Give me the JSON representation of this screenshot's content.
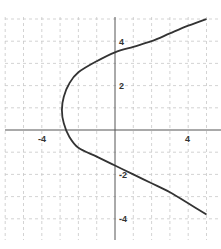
{
  "chart_data": {
    "type": "line",
    "title": "",
    "xlabel": "",
    "ylabel": "",
    "xlim": [
      -6.3,
      5.7
    ],
    "ylim": [
      -5.4,
      5.9
    ],
    "grid": true,
    "x_ticks": [
      -4,
      4
    ],
    "y_ticks": [
      4,
      2,
      -2,
      -4
    ],
    "x_tick_labels": [
      "-4",
      "4"
    ],
    "y_tick_labels": [
      "4",
      "2",
      "-2",
      "-4"
    ],
    "series": [
      {
        "name": "parabola (opens left)",
        "color": "#333333",
        "points": [
          [
            5.0,
            5.0
          ],
          [
            4.0,
            4.7
          ],
          [
            3.0,
            4.35
          ],
          [
            2.0,
            4.0
          ],
          [
            1.0,
            3.75
          ],
          [
            0.0,
            3.5
          ],
          [
            -1.0,
            3.1
          ],
          [
            -2.0,
            2.6
          ],
          [
            -2.5,
            2.1
          ],
          [
            -2.8,
            1.5
          ],
          [
            -2.9,
            0.9
          ],
          [
            -2.8,
            0.3
          ],
          [
            -2.5,
            -0.3
          ],
          [
            -2.0,
            -0.8
          ],
          [
            -1.0,
            -1.2
          ],
          [
            0.0,
            -1.6
          ],
          [
            1.0,
            -2.0
          ],
          [
            2.0,
            -2.4
          ],
          [
            3.0,
            -2.8
          ],
          [
            4.0,
            -3.3
          ],
          [
            5.0,
            -3.8
          ]
        ]
      }
    ]
  },
  "labels": {
    "x_neg4": "-4",
    "x_pos4": "4",
    "y_pos4": "4",
    "y_pos2": "2",
    "y_neg2": "-2",
    "y_neg4": "-4"
  }
}
